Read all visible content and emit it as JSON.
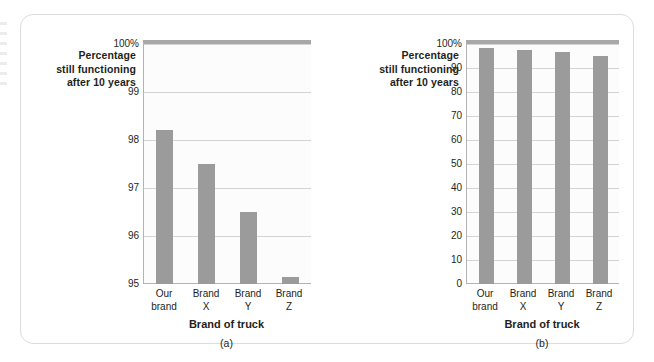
{
  "figure": {
    "bar_color": "#9b9b9b",
    "grid_color": "#d4d4d4",
    "axis_color": "#b3b3b3",
    "panel_border_color": "#dcdcdc",
    "text_color": "#231f20"
  },
  "chart_data": [
    {
      "type": "bar",
      "panel": "a",
      "caption": "(a)",
      "title": "",
      "ylabel": "Percentage still functioning after 10 years",
      "ylabel_lines": [
        "Percentage",
        "still functioning",
        "after 10 years"
      ],
      "xlabel": "Brand of truck",
      "categories": [
        "Our brand",
        "Brand X",
        "Brand Y",
        "Brand Z"
      ],
      "category_lines": [
        [
          "Our",
          "brand"
        ],
        [
          "Brand",
          "X"
        ],
        [
          "Brand",
          "Y"
        ],
        [
          "Brand",
          "Z"
        ]
      ],
      "values": [
        98.2,
        97.5,
        96.5,
        95.15
      ],
      "ylim": [
        95,
        100
      ],
      "yticks": [
        95,
        96,
        97,
        98,
        99,
        100
      ],
      "ytick_labels": [
        "95",
        "96",
        "97",
        "98",
        "99",
        "100%"
      ],
      "grid": true,
      "legend": "none",
      "note": "truncated y-axis exaggerates differences"
    },
    {
      "type": "bar",
      "panel": "b",
      "caption": "(b)",
      "title": "",
      "ylabel": "Percentage still functioning after 10 years",
      "ylabel_lines": [
        "Percentage",
        "still functioning",
        "after 10 years"
      ],
      "xlabel": "Brand of truck",
      "categories": [
        "Our brand",
        "Brand X",
        "Brand Y",
        "Brand Z"
      ],
      "category_lines": [
        [
          "Our",
          "brand"
        ],
        [
          "Brand",
          "X"
        ],
        [
          "Brand",
          "Y"
        ],
        [
          "Brand",
          "Z"
        ]
      ],
      "values": [
        98.2,
        97.5,
        96.5,
        95.15
      ],
      "ylim": [
        0,
        100
      ],
      "yticks": [
        0,
        10,
        20,
        30,
        40,
        50,
        60,
        70,
        80,
        90,
        100
      ],
      "ytick_labels": [
        "0",
        "10",
        "20",
        "30",
        "40",
        "50",
        "60",
        "70",
        "80",
        "90",
        "100%"
      ],
      "grid": true,
      "legend": "none",
      "note": "full y-axis shows differences are negligible"
    }
  ]
}
